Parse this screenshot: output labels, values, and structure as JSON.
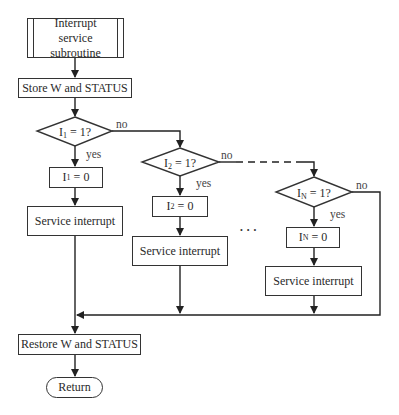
{
  "diagram": {
    "type": "flowchart",
    "nodes": {
      "start": {
        "label": "Interrupt service subroutine",
        "lines": [
          "Interrupt",
          "service",
          "subroutine"
        ],
        "shape": "predefined-process"
      },
      "store": {
        "label": "Store W and STATUS",
        "shape": "process"
      },
      "decision1": {
        "var": "I",
        "sub": "1",
        "rest": " = 1?",
        "shape": "decision"
      },
      "clear1": {
        "var": "I",
        "sub": "1",
        "rest": " = 0",
        "shape": "process"
      },
      "service1": {
        "label": "Service interrupt",
        "shape": "process"
      },
      "decision2": {
        "var": "I",
        "sub": "2",
        "rest": " = 1?",
        "shape": "decision"
      },
      "clear2": {
        "var": "I",
        "sub": "2",
        "rest": " = 0",
        "shape": "process"
      },
      "service2": {
        "label": "Service interrupt",
        "shape": "process"
      },
      "decisionN": {
        "var": "I",
        "sub": "N",
        "rest": " = 1?",
        "shape": "decision"
      },
      "clearN": {
        "var": "I",
        "sub": "N",
        "rest": " = 0",
        "shape": "process"
      },
      "serviceN": {
        "label": "Service interrupt",
        "shape": "process"
      },
      "restore": {
        "label": "Restore W and STATUS",
        "shape": "process"
      },
      "return": {
        "label": "Return",
        "shape": "terminator"
      }
    },
    "edge_labels": {
      "yes": "yes",
      "no": "no"
    },
    "ellipsis": "• • •"
  }
}
